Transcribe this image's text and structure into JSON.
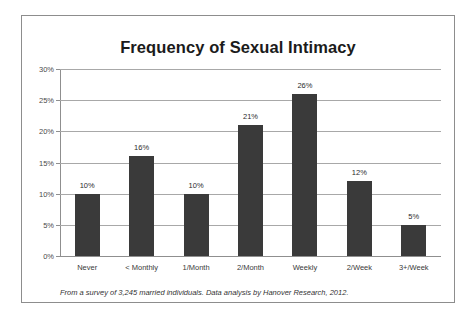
{
  "chart_data": {
    "type": "bar",
    "title": "Frequency of Sexual Intimacy",
    "xlabel": "",
    "ylabel": "",
    "categories": [
      "Never",
      "< Monthly",
      "1/Month",
      "2/Month",
      "Weekly",
      "2/Week",
      "3+/Week"
    ],
    "values": [
      10,
      16,
      10,
      21,
      26,
      12,
      5
    ],
    "value_labels": [
      "10%",
      "16%",
      "10%",
      "21%",
      "26%",
      "12%",
      "5%"
    ],
    "ylim": [
      0,
      30
    ],
    "ytick_values": [
      0,
      5,
      10,
      15,
      20,
      25,
      30
    ],
    "ytick_labels": [
      "0%",
      "5%",
      "10%",
      "15%",
      "20%",
      "25%",
      "30%"
    ],
    "grid": true,
    "legend": false,
    "bar_color": "#3a3a3a",
    "gridline_color": "#a8a8a8",
    "axis_color": "#8f8f8f",
    "series": [
      {
        "name": "Frequency of Sexual Intimacy",
        "values": [
          10,
          16,
          10,
          21,
          26,
          12,
          5
        ]
      }
    ]
  },
  "footnote": "From a survey of 3,245 married individuals. Data analysis by Hanover Research, 2012."
}
